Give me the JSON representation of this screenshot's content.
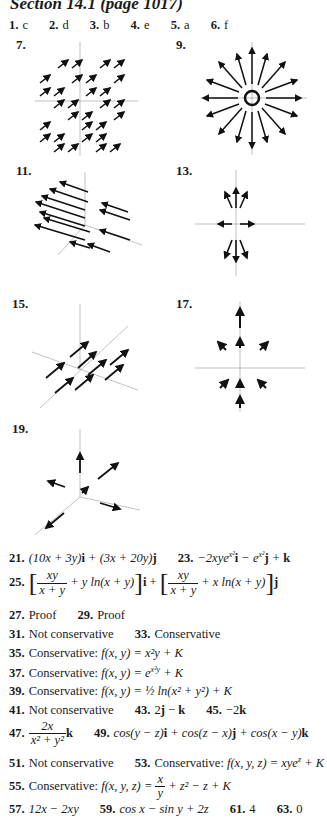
{
  "header": {
    "title": "Section 14.1 (page 1017)"
  },
  "row1": [
    {
      "num": "1.",
      "ans": "c"
    },
    {
      "num": "2.",
      "ans": "d"
    },
    {
      "num": "3.",
      "ans": "b"
    },
    {
      "num": "4.",
      "ans": "e"
    },
    {
      "num": "5.",
      "ans": "a"
    },
    {
      "num": "6.",
      "ans": "f"
    }
  ],
  "figures": [
    {
      "num": "7.",
      "desc": "2D vector field, all arrows pointing up-right",
      "axes": {
        "x": "x",
        "y": "y",
        "ticks": [
          "-4",
          "1",
          "-4"
        ]
      }
    },
    {
      "num": "9.",
      "desc": "radial vector field outward from circle",
      "axes": {
        "x": "x",
        "y": "y",
        "ticks": [
          "5",
          "-5",
          "3",
          "5",
          "-5"
        ]
      }
    },
    {
      "num": "11.",
      "desc": "3D vector field, arrows pointing in -y direction",
      "axes": {
        "x": "x",
        "y": "y",
        "z": "z",
        "ticks": [
          "4",
          "2",
          "4"
        ]
      }
    },
    {
      "num": "13.",
      "desc": "2D vector field near origin",
      "axes": {
        "x": "x",
        "y": "y",
        "ticks": [
          "2",
          "-2",
          "-1",
          "1",
          "2",
          "-2"
        ]
      }
    },
    {
      "num": "15.",
      "desc": "3D vector field, arrows along y direction",
      "axes": {
        "x": "x",
        "y": "y",
        "z": "z",
        "ticks": [
          "4",
          "-4",
          "4",
          "-4",
          "1",
          "1",
          "1",
          "4"
        ]
      }
    },
    {
      "num": "17.",
      "desc": "2D vector field, radial-ish small arrows",
      "axes": {
        "x": "x",
        "y": "y",
        "ticks": [
          "2",
          "1",
          "-2",
          "-1",
          "1",
          "2",
          "-1",
          "-2"
        ]
      }
    },
    {
      "num": "19.",
      "desc": "3D vector field, few arrows",
      "axes": {
        "x": "x",
        "y": "y",
        "z": "z",
        "ticks": [
          "2",
          "1",
          "1",
          "2",
          "1",
          "2"
        ]
      }
    }
  ],
  "answers": {
    "a21": {
      "num": "21."
    },
    "a23": {
      "num": "23."
    },
    "a25": {
      "num": "25."
    },
    "a27": {
      "num": "27.",
      "text": "Proof"
    },
    "a29": {
      "num": "29.",
      "text": "Proof"
    },
    "a31": {
      "num": "31.",
      "text": "Not conservative"
    },
    "a33": {
      "num": "33.",
      "text": "Conservative"
    },
    "a35": {
      "num": "35.",
      "text": "Conservative:"
    },
    "a37": {
      "num": "37.",
      "text": "Conservative:"
    },
    "a39": {
      "num": "39.",
      "text": "Conservative:"
    },
    "a41": {
      "num": "41.",
      "text": "Not conservative"
    },
    "a43": {
      "num": "43."
    },
    "a45": {
      "num": "45."
    },
    "a47": {
      "num": "47."
    },
    "a49": {
      "num": "49."
    },
    "a51": {
      "num": "51.",
      "text": "Not conservative"
    },
    "a53": {
      "num": "53.",
      "text": "Conservative:"
    },
    "a55": {
      "num": "55.",
      "text": "Conservative:"
    },
    "a57": {
      "num": "57."
    },
    "a59": {
      "num": "59."
    },
    "a61": {
      "num": "61.",
      "text": "4"
    },
    "a63": {
      "num": "63.",
      "text": "0"
    }
  }
}
